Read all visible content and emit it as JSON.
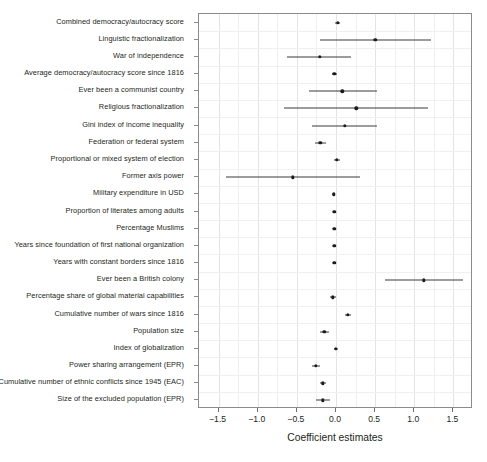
{
  "chart_data": {
    "type": "scatter",
    "title": "",
    "xlabel": "Coefficient estimates",
    "ylabel": "",
    "xlim": [
      -1.75,
      1.75
    ],
    "ylim": [
      0,
      23
    ],
    "grid": true,
    "legend": null,
    "orientation": "horizontal",
    "xticks": [
      -1.5,
      -1.0,
      -0.5,
      0.0,
      0.5,
      1.0,
      1.5
    ],
    "xticklabels": [
      "−1.5",
      "−1.0",
      "−0.5",
      "0.0",
      "0.5",
      "1.0",
      "1.5"
    ],
    "categories": [
      "Combined democracy/autocracy score",
      "Linguistic fractionalization",
      "War of independence",
      "Average democracy/autocracy score since 1816",
      "Ever been a communist country",
      "Religious fractionalization",
      "Gini index of income inequality",
      "Federation or federal system",
      "Proportional or mixed system of election",
      "Former axis power",
      "Military expenditure in USD",
      "Proportion of literates among adults",
      "Percentage Muslims",
      "Years since foundation of first national organization",
      "Years with constant borders since 1816",
      "Ever been a British colony",
      "Percentage share of global material capabilities",
      "Cumulative number of wars since 1816",
      "Population size",
      "Index of globalization",
      "Power sharing arrangement (EPR)",
      "Cumulative number of ethnic conflicts since 1945 (EAC)",
      "Size of the excluded population (EPR)"
    ],
    "estimates": [
      0.02,
      0.5,
      -0.21,
      -0.02,
      0.08,
      0.26,
      0.11,
      -0.2,
      0.01,
      -0.55,
      -0.03,
      -0.02,
      -0.02,
      -0.02,
      -0.02,
      1.12,
      -0.04,
      0.15,
      -0.15,
      0.0,
      -0.26,
      -0.17,
      -0.17
    ],
    "ci_low": [
      -0.01,
      -0.21,
      -0.63,
      -0.05,
      -0.34,
      -0.66,
      -0.31,
      -0.27,
      -0.03,
      -1.4,
      -0.05,
      -0.04,
      -0.04,
      -0.04,
      -0.04,
      0.62,
      -0.08,
      0.11,
      -0.21,
      -0.03,
      -0.31,
      -0.21,
      -0.26
    ],
    "ci_high": [
      0.05,
      1.21,
      0.19,
      0.01,
      0.52,
      1.17,
      0.53,
      -0.13,
      0.05,
      0.31,
      -0.01,
      0.0,
      0.0,
      0.0,
      0.0,
      1.62,
      0.0,
      0.19,
      -0.09,
      0.03,
      -0.21,
      -0.13,
      -0.08
    ],
    "colors": {
      "point": "#1b1b1b",
      "errorbar": "#3a3a3a",
      "frame": "#8b8b8b",
      "grid": "#e4e4e4",
      "background": "#ffffff",
      "text": "#231f20"
    }
  }
}
